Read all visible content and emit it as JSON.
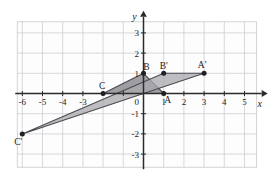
{
  "figure": {
    "title": "",
    "background_color": "#ffffff"
  },
  "chart_data": {
    "type": "scatter",
    "title": "",
    "xlabel": "x",
    "ylabel": "y",
    "xlim": [
      -7,
      6
    ],
    "ylim": [
      -4,
      4
    ],
    "grid": true,
    "grid_spacing": 1,
    "grid_color": "#c9c9cf",
    "axis_color": "#2b2b2b",
    "x_ticks": [
      -6,
      -5,
      -4,
      -3,
      -2,
      -1,
      1,
      2,
      3,
      4,
      5
    ],
    "x_tick_labels": [
      "-6",
      "-5",
      "-4",
      "-3",
      "",
      "",
      "1",
      "2",
      "3",
      "4",
      "5"
    ],
    "y_ticks": [
      3,
      2,
      1,
      -1,
      -2,
      -3
    ],
    "y_tick_labels": [
      "3",
      "2",
      "1",
      "-1",
      "-2",
      "-3"
    ],
    "origin_label": "0",
    "series": [
      {
        "name": "Triangle ABC",
        "kind": "polygon",
        "fill": "#8d8d93",
        "fill_opacity": 0.85,
        "stroke": "#4a4a50",
        "points": [
          {
            "label": "A",
            "x": 1,
            "y": 0
          },
          {
            "label": "B",
            "x": 0,
            "y": 1
          },
          {
            "label": "C",
            "x": -2,
            "y": 0
          }
        ]
      },
      {
        "name": "Triangle A'B'C'",
        "kind": "polygon",
        "fill": "#a8a8ad",
        "fill_opacity": 0.75,
        "stroke": "#4a4a50",
        "points": [
          {
            "label": "A'",
            "x": 3,
            "y": 1
          },
          {
            "label": "B'",
            "x": 1,
            "y": 1
          },
          {
            "label": "C'",
            "x": -6,
            "y": -2
          }
        ]
      }
    ],
    "vertex_labels": [
      {
        "text": "A",
        "x": 1,
        "y": 0,
        "dx": 4,
        "dy": 9
      },
      {
        "text": "B",
        "x": 0,
        "y": 1,
        "dx": 3,
        "dy": -3
      },
      {
        "text": "C",
        "x": -2,
        "y": 0,
        "dx": -1,
        "dy": -5
      },
      {
        "text": "A'",
        "x": 3,
        "y": 1,
        "dx": -2,
        "dy": -5
      },
      {
        "text": "B'",
        "x": 1,
        "y": 1,
        "dx": 0,
        "dy": -4
      },
      {
        "text": "C'",
        "x": -6,
        "y": -2,
        "dx": -4,
        "dy": 11
      }
    ]
  }
}
